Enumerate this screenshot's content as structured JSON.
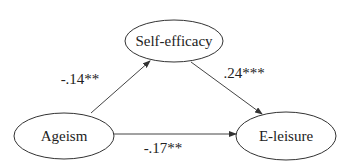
{
  "diagram": {
    "type": "mediation-path-model",
    "nodes": [
      {
        "id": "self_efficacy",
        "label": "Self-efficacy",
        "cx": 174,
        "cy": 41,
        "rx": 49,
        "ry": 21
      },
      {
        "id": "ageism",
        "label": "Ageism",
        "cx": 64,
        "cy": 136,
        "rx": 50,
        "ry": 23
      },
      {
        "id": "e_leisure",
        "label": "E-leisure",
        "cx": 286,
        "cy": 136,
        "rx": 50,
        "ry": 24
      }
    ],
    "edges": [
      {
        "from": "ageism",
        "to": "self_efficacy",
        "coefficient": "-.14**"
      },
      {
        "from": "self_efficacy",
        "to": "e_leisure",
        "coefficient": ".24***"
      },
      {
        "from": "ageism",
        "to": "e_leisure",
        "coefficient": "-.17**"
      }
    ]
  },
  "colors": {
    "stroke": "#333333",
    "text": "#222222",
    "background": "#ffffff"
  }
}
